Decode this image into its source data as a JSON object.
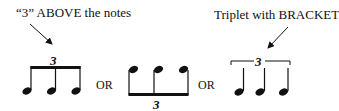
{
  "diagram": {
    "labels": {
      "above": "“3” ABOVE the notes",
      "bracket": "Triplet with BRACKET"
    },
    "separators": [
      "OR",
      "OR"
    ],
    "groups": [
      {
        "name": "beamed-stems-up-number-above",
        "tuplet_number": "3",
        "notes": 3,
        "stem_direction": "up",
        "grouping": "beam"
      },
      {
        "name": "beamed-stems-down-number-below",
        "tuplet_number": "3",
        "notes": 3,
        "stem_direction": "down",
        "grouping": "beam"
      },
      {
        "name": "quarter-notes-with-bracket",
        "tuplet_number": "3",
        "notes": 3,
        "stem_direction": "up",
        "grouping": "bracket"
      }
    ],
    "colors": {
      "ink": "#111111",
      "background": "#ffffff"
    }
  }
}
